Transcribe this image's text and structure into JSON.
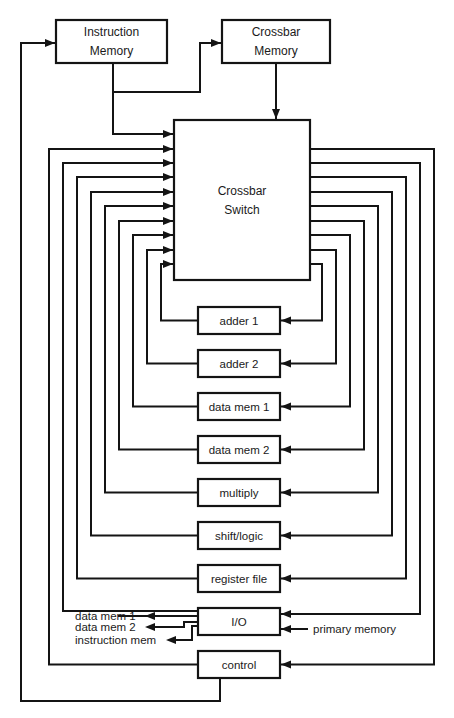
{
  "colors": {
    "line": "#141414",
    "background": "#ffffff",
    "text": "#1a1a1a"
  },
  "top_boxes": [
    {
      "id": "instruction-memory",
      "lines": [
        "Instruction",
        "Memory"
      ],
      "x": 56,
      "y": 20,
      "w": 111,
      "h": 43
    },
    {
      "id": "crossbar-memory",
      "lines": [
        "Crossbar",
        "Memory"
      ],
      "x": 222,
      "y": 20,
      "w": 108,
      "h": 43
    }
  ],
  "crossbar_switch": {
    "id": "crossbar-switch",
    "lines": [
      "Crossbar",
      "Switch"
    ],
    "x": 174,
    "y": 120,
    "w": 136,
    "h": 160
  },
  "units": [
    {
      "id": "adder-1",
      "label": "adder 1",
      "y": 307,
      "left_x": 161,
      "right_x": 322,
      "in_y": 264
    },
    {
      "id": "adder-2",
      "label": "adder 2",
      "y": 350,
      "left_x": 147,
      "right_x": 336,
      "in_y": 250
    },
    {
      "id": "data-mem-1",
      "label": "data mem 1",
      "y": 393,
      "left_x": 133,
      "right_x": 350,
      "in_y": 235
    },
    {
      "id": "data-mem-2",
      "label": "data mem 2",
      "y": 436,
      "left_x": 119,
      "right_x": 364,
      "in_y": 221
    },
    {
      "id": "multiply",
      "label": "multiply",
      "y": 479,
      "left_x": 105,
      "right_x": 378,
      "in_y": 206
    },
    {
      "id": "shift-logic",
      "label": "shift/logic",
      "y": 522,
      "left_x": 91,
      "right_x": 392,
      "in_y": 192
    },
    {
      "id": "register-file",
      "label": "register file",
      "y": 565,
      "left_x": 77,
      "right_x": 406,
      "in_y": 177
    },
    {
      "id": "io",
      "label": "I/O",
      "y": 608,
      "left_x": 63,
      "right_x": 420,
      "in_y": 163
    },
    {
      "id": "control",
      "label": "control",
      "y": 651,
      "left_x": 49,
      "right_x": 434,
      "in_y": 149
    }
  ],
  "unit_box": {
    "x": 198,
    "w": 82,
    "h": 27
  },
  "io_outputs": [
    {
      "label": "data mem 1"
    },
    {
      "label": "data mem 2"
    },
    {
      "label": "instruction mem"
    }
  ],
  "io_input": {
    "label": "primary memory"
  }
}
